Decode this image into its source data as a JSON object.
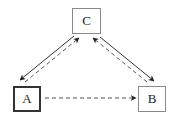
{
  "diagram": {
    "nodes": [
      {
        "id": "C",
        "label": "C",
        "x": 72,
        "y": 8,
        "w": 29,
        "h": 26,
        "style": "normal"
      },
      {
        "id": "A",
        "label": "A",
        "x": 13,
        "y": 86,
        "w": 28,
        "h": 26,
        "style": "strong"
      },
      {
        "id": "B",
        "label": "B",
        "x": 138,
        "y": 86,
        "w": 28,
        "h": 26,
        "style": "normal"
      }
    ],
    "edges": [
      {
        "from": "C",
        "to": "A",
        "line": "solid",
        "x1": 74,
        "y1": 36,
        "x2": 20,
        "y2": 80
      },
      {
        "from": "A",
        "to": "C",
        "line": "dashed",
        "x1": 25,
        "y1": 82,
        "x2": 79,
        "y2": 38
      },
      {
        "from": "C",
        "to": "B",
        "line": "solid",
        "x1": 100,
        "y1": 37,
        "x2": 154,
        "y2": 81
      },
      {
        "from": "B",
        "to": "C",
        "line": "dashed",
        "x1": 147,
        "y1": 82,
        "x2": 93,
        "y2": 38
      },
      {
        "from": "A",
        "to": "B",
        "line": "dashed",
        "x1": 45,
        "y1": 98,
        "x2": 136,
        "y2": 98
      }
    ],
    "colors": {
      "stroke": "#333333",
      "border": "#8a8a8a",
      "text": "#222222"
    }
  }
}
